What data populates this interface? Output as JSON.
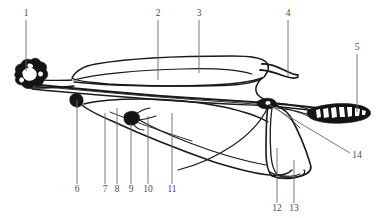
{
  "figure": {
    "background_color": "#ffffff",
    "line_color": "#1a1a1a",
    "leader_color": "#6a6a6a",
    "label_color": "#4a4a4a",
    "width": 377,
    "height": 218
  },
  "labels": [
    {
      "id": "1",
      "text": "1",
      "x": 26,
      "y": 16,
      "leader": {
        "x1": 26,
        "y1": 20,
        "x2": 26,
        "y2": 71
      }
    },
    {
      "id": "2",
      "text": "2",
      "x": 158,
      "y": 16,
      "leader": {
        "x1": 158,
        "y1": 20,
        "x2": 158,
        "y2": 80
      }
    },
    {
      "id": "3",
      "text": "3",
      "x": 199,
      "y": 16,
      "leader": {
        "x1": 199,
        "y1": 20,
        "x2": 199,
        "y2": 73
      }
    },
    {
      "id": "4",
      "text": "4",
      "x": 288,
      "y": 16,
      "leader": {
        "x1": 288,
        "y1": 20,
        "x2": 288,
        "y2": 76
      }
    },
    {
      "id": "5",
      "text": "5",
      "x": 357,
      "y": 50,
      "leader": {
        "x1": 357,
        "y1": 54,
        "x2": 357,
        "y2": 112
      }
    },
    {
      "id": "6",
      "text": "6",
      "x": 77,
      "y": 192,
      "leader": {
        "x1": 77,
        "y1": 100,
        "x2": 77,
        "y2": 184
      }
    },
    {
      "id": "7",
      "text": "7",
      "x": 105,
      "y": 192,
      "leader": {
        "x1": 105,
        "y1": 113,
        "x2": 105,
        "y2": 184
      }
    },
    {
      "id": "8",
      "text": "8",
      "x": 117,
      "y": 192,
      "leader": {
        "x1": 117,
        "y1": 108,
        "x2": 117,
        "y2": 184
      }
    },
    {
      "id": "9",
      "text": "9",
      "x": 131,
      "y": 192,
      "leader": {
        "x1": 131,
        "y1": 124,
        "x2": 131,
        "y2": 184
      }
    },
    {
      "id": "10",
      "text": "10",
      "x": 148,
      "y": 192,
      "leader": {
        "x1": 148,
        "y1": 116,
        "x2": 148,
        "y2": 184
      }
    },
    {
      "id": "11",
      "text": "11",
      "x": 172,
      "y": 192,
      "leader": {
        "x1": 172,
        "y1": 113,
        "x2": 172,
        "y2": 184
      }
    },
    {
      "id": "12",
      "text": "12",
      "x": 277,
      "y": 211,
      "leader": {
        "x1": 277,
        "y1": 148,
        "x2": 277,
        "y2": 203
      }
    },
    {
      "id": "13",
      "text": "13",
      "x": 294,
      "y": 211,
      "leader": {
        "x1": 294,
        "y1": 160,
        "x2": 294,
        "y2": 203
      }
    },
    {
      "id": "14",
      "text": "14",
      "x": 357,
      "y": 158,
      "leader": {
        "x1": 268,
        "y1": 104,
        "x2": 350,
        "y2": 153
      }
    }
  ],
  "drawing_parts": [
    {
      "name": "left-knob-cluster",
      "role": "solid-dark-terminal-structure-at-left-end"
    },
    {
      "name": "right-ovoid-body",
      "role": "solid-dark-ovoid-with-white-internal-markings-at-right-end"
    },
    {
      "name": "upper-elongate-blade",
      "role": "large-upper-outline-running-left-to-right"
    },
    {
      "name": "central-shaft",
      "role": "long-thin-central-axis-lines"
    },
    {
      "name": "lower-blade",
      "role": "broad-lower-outline-sheet"
    },
    {
      "name": "lower-skirt",
      "role": "rounded-lower-right-flap"
    },
    {
      "name": "right-joint-knot",
      "role": "small-dark-joint-node-at-right-of-shaft"
    },
    {
      "name": "left-joint-knot",
      "role": "small-dark-joint-node-at-left-of-shaft"
    },
    {
      "name": "mid-joint-knot",
      "role": "small-dark-joint-node-mid-lower-region"
    },
    {
      "name": "upper-spur",
      "role": "thin-hook-shaped-process-upper-right"
    }
  ]
}
